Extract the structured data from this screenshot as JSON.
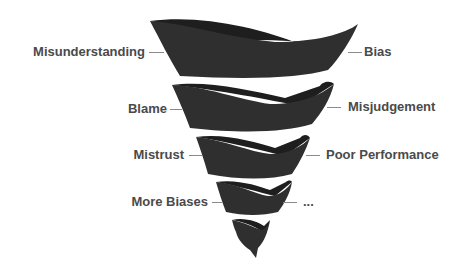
{
  "diagram": {
    "type": "spiral-funnel",
    "colors": {
      "band": "#2f2f2f",
      "band_inner": "#1e1e1e",
      "text": "#4a4a4a",
      "connector": "#8a8a8a",
      "background": "#ffffff"
    },
    "left_labels": [
      {
        "text": "Misunderstanding"
      },
      {
        "text": "Blame"
      },
      {
        "text": "Mistrust"
      },
      {
        "text": "More Biases"
      }
    ],
    "right_labels": [
      {
        "text": "Bias"
      },
      {
        "text": "Misjudgement"
      },
      {
        "text": "Poor Performance"
      },
      {
        "text": "..."
      }
    ]
  }
}
